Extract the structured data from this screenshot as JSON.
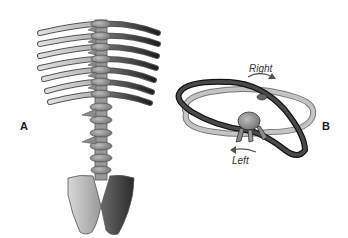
{
  "figure": {
    "panels": [
      {
        "id": "A",
        "label": "A",
        "subject": "spine-with-ribs-and-pelvis"
      },
      {
        "id": "B",
        "label": "B",
        "subject": "rib-ring-rotation"
      }
    ],
    "annotations": {
      "right": "Right",
      "left": "Left"
    },
    "colors": {
      "light_bone": "#c8c8c8",
      "dark_bone": "#3a3a3a",
      "mid_bone": "#8a8a8a",
      "outline": "#555555"
    }
  }
}
